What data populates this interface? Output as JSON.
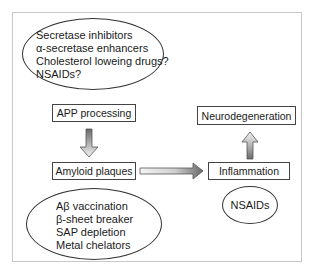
{
  "diagram": {
    "top_interventions": {
      "items": [
        "Secretase inhibitors",
        "α-secretase enhancers",
        "Cholesterol loweing drugs?",
        "NSAIDs?"
      ]
    },
    "nodes": {
      "app_processing": "APP processing",
      "amyloid_plaques": "Amyloid plaques",
      "inflammation": "Inflammation",
      "neurodegeneration": "Neurodegeneration"
    },
    "bottom_interventions": {
      "items": [
        "Aβ vaccination",
        "β-sheet breaker",
        "SAP depletion",
        "Metal chelators"
      ]
    },
    "inflammation_intervention": "NSAIDs",
    "edges": [
      {
        "from": "APP processing",
        "to": "Amyloid plaques"
      },
      {
        "from": "Amyloid plaques",
        "to": "Inflammation"
      },
      {
        "from": "Inflammation",
        "to": "Neurodegeneration"
      }
    ]
  }
}
